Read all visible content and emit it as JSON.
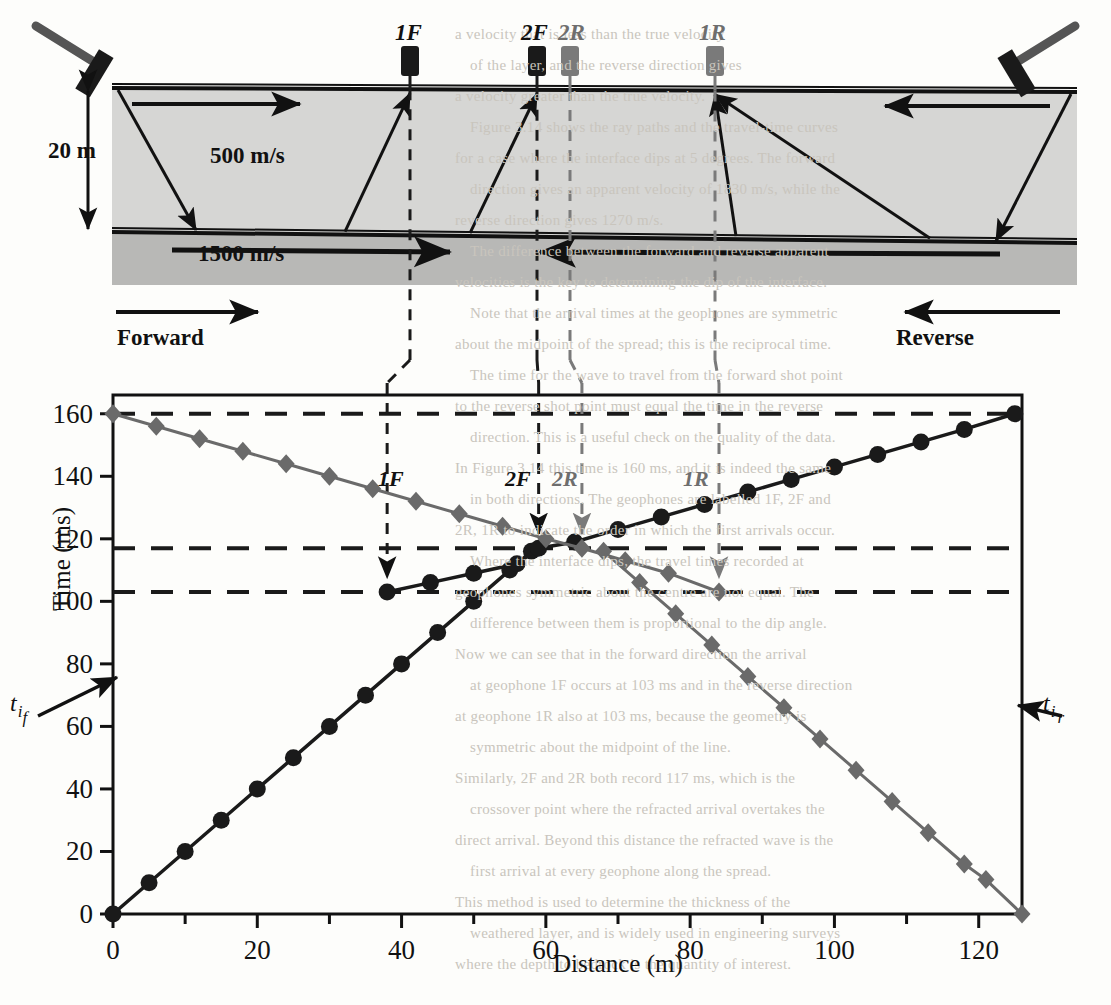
{
  "figure": {
    "upper_diagram": {
      "layer1_velocity": "500 m/s",
      "layer2_velocity": "1500 m/s",
      "depth_label": "20 m",
      "forward_label": "Forward",
      "reverse_label": "Reverse",
      "geophones": [
        {
          "id": "1F",
          "label": "1F",
          "x_m": 38,
          "color": "#1a1a1a",
          "direction": "forward"
        },
        {
          "id": "2F",
          "label": "2F",
          "x_m": 59,
          "color": "#1a1a1a",
          "direction": "forward"
        },
        {
          "id": "2R",
          "label": "2R",
          "x_m": 65,
          "color": "#7a7a7a",
          "direction": "reverse"
        },
        {
          "id": "1R",
          "label": "1R",
          "x_m": 84,
          "color": "#7a7a7a",
          "direction": "reverse"
        }
      ],
      "sources": [
        {
          "id": "forward-source",
          "name": "hammer-left",
          "x_m": 0
        },
        {
          "id": "reverse-source",
          "name": "hammer-right",
          "x_m": 126
        }
      ]
    },
    "intercepts": {
      "forward_label_t": "t",
      "forward_label_sub": "i",
      "forward_label_sub2": "f",
      "reverse_label_t": "t",
      "reverse_label_sub": "i",
      "reverse_label_sub2": "r",
      "forward_value_ms": 77,
      "reverse_value_ms": 68
    }
  },
  "chart_data": {
    "type": "line",
    "title": "",
    "xlabel": "Distance (m)",
    "ylabel": "Time (ms)",
    "xlim": [
      0,
      126
    ],
    "ylim": [
      0,
      166
    ],
    "xticks": [
      0,
      20,
      40,
      60,
      80,
      100,
      120
    ],
    "xticks_minor": [
      10,
      30,
      50,
      70,
      90,
      110
    ],
    "yticks": [
      0,
      20,
      40,
      60,
      80,
      100,
      120,
      140,
      160
    ],
    "grid": false,
    "legend": "none",
    "reference_lines": [
      {
        "name": "t-max-forward",
        "y_ms": 160,
        "color": "#1a1a1a"
      },
      {
        "name": "t-crossover",
        "y_ms": 117,
        "color": "#1a1a1a"
      },
      {
        "name": "t-geophone-1",
        "y_ms": 103,
        "color": "#1a1a1a"
      }
    ],
    "annotations": [
      {
        "label": "1F",
        "x_m": 38,
        "y_ms": 103,
        "color": "#1a1a1a",
        "style": "italic"
      },
      {
        "label": "2F",
        "x_m": 59,
        "y_ms": 117,
        "color": "#1a1a1a",
        "style": "italic"
      },
      {
        "label": "2R",
        "x_m": 65,
        "y_ms": 117,
        "color": "#7a7a7a",
        "style": "italic"
      },
      {
        "label": "1R",
        "x_m": 84,
        "y_ms": 103,
        "color": "#7a7a7a",
        "style": "italic"
      }
    ],
    "series": [
      {
        "name": "Forward direct wave",
        "marker": "circle",
        "color": "#1a1a1a",
        "x": [
          0,
          5,
          10,
          15,
          20,
          25,
          30,
          35,
          40,
          45,
          50,
          55,
          58
        ],
        "y": [
          0,
          10,
          20,
          30,
          40,
          50,
          60,
          70,
          80,
          90,
          100,
          110,
          116
        ]
      },
      {
        "name": "Forward refracted wave",
        "marker": "circle",
        "color": "#1a1a1a",
        "x": [
          38,
          44,
          50,
          56,
          59,
          64,
          70,
          76,
          82,
          88,
          94,
          100,
          106,
          112,
          118,
          125
        ],
        "y": [
          103,
          106,
          109,
          112,
          117,
          119,
          123,
          127,
          131,
          135,
          139,
          143,
          147,
          151,
          155,
          160
        ]
      },
      {
        "name": "Reverse direct wave",
        "marker": "diamond",
        "color": "#6a6a6a",
        "x": [
          68,
          73,
          78,
          83,
          88,
          93,
          98,
          103,
          108,
          113,
          118,
          121,
          126
        ],
        "y": [
          116,
          106,
          96,
          86,
          76,
          66,
          56,
          46,
          36,
          26,
          16,
          11,
          0
        ]
      },
      {
        "name": "Reverse refracted wave",
        "marker": "diamond",
        "color": "#6a6a6a",
        "x": [
          0,
          6,
          12,
          18,
          24,
          30,
          36,
          42,
          48,
          54,
          60,
          65,
          71,
          77,
          84
        ],
        "y": [
          160,
          156,
          152,
          148,
          144,
          140,
          136,
          132,
          128,
          124,
          120,
          117,
          113,
          109,
          103
        ]
      }
    ]
  },
  "background_text": [
    "a velocity that is less than the true velocity",
    "of the layer, and the reverse direction gives",
    "a velocity greater than the true velocity.",
    "Figure 3.14 shows the ray paths and the travel-time curves",
    "for a case where the interface dips at 5 degrees. The forward",
    "direction gives an apparent velocity of 1830 m/s, while the",
    "reverse direction gives 1270 m/s.",
    "The difference between the forward and reverse apparent",
    "velocities is the key to determining the dip of the interface.",
    "Note that the arrival times at the geophones are symmetric",
    "about the midpoint of the spread; this is the reciprocal time.",
    "The time for the wave to travel from the forward shot point",
    "to the reverse shot point must equal the time in the reverse",
    "direction. This is a useful check on the quality of the data.",
    "In Figure 3.14 this time is 160 ms, and it is indeed the same",
    "in both directions. The geophones are labelled 1F, 2F and",
    "2R, 1R to indicate the order in which the first arrivals occur.",
    "Where the interface dips, the travel times recorded at",
    "geophones symmetric about the centre are not equal. The",
    "difference between them is proportional to the dip angle.",
    "Now we can see that in the forward direction the arrival",
    "at geophone 1F occurs at 103 ms and in the reverse direction",
    "at geophone 1R also at 103 ms, because the geometry is",
    "symmetric about the midpoint of the line.",
    "Similarly, 2F and 2R both record 117 ms, which is the",
    "crossover point where the refracted arrival overtakes the",
    "direct arrival. Beyond this distance the refracted wave is the",
    "first arrival at every geophone along the spread.",
    "This method is used to determine the thickness of the",
    "weathered layer, and is widely used in engineering surveys",
    "where the depth to bedrock is the quantity of interest."
  ]
}
